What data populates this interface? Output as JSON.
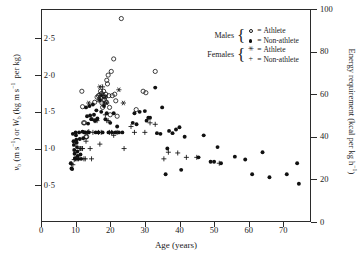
{
  "chart_data": {
    "type": "scatter",
    "title": "",
    "xlabel": "Age (years)",
    "ylabel": "v_b (m s^-1) or W_b (kg m s^-1 per kg)",
    "y2label": "Energy requirement (kcal per kg h^-1)",
    "xlim": [
      0,
      78
    ],
    "ylim": [
      0,
      2.9
    ],
    "y2lim": [
      0,
      100
    ],
    "grid": false,
    "legend_position": "top-right",
    "xticks": [
      0,
      10,
      20,
      30,
      40,
      50,
      60,
      70
    ],
    "xticklabels": [
      "0",
      "10",
      "20",
      "30",
      "40",
      "50",
      "60",
      "70"
    ],
    "yticks": [
      0.5,
      1.0,
      1.5,
      2.0,
      2.5
    ],
    "yticklabels": [
      "0·5",
      "1·0",
      "1·5",
      "2·0",
      "2·5"
    ],
    "y2ticks": [
      0,
      20,
      40,
      60,
      80,
      100
    ],
    "y2ticklabels": [
      "0",
      "20",
      "40",
      "60",
      "80",
      "100"
    ],
    "series": [
      {
        "name": "Males — Athlete",
        "marker": "open-circle",
        "points": [
          [
            11.8,
            1.78
          ],
          [
            12.0,
            1.57
          ],
          [
            12.3,
            1.35
          ],
          [
            12.6,
            1.35
          ],
          [
            13.0,
            1.16
          ],
          [
            13.2,
            1.16
          ],
          [
            15.5,
            1.63
          ],
          [
            16.2,
            1.7
          ],
          [
            16.6,
            1.72
          ],
          [
            16.8,
            1.66
          ],
          [
            17.0,
            1.73
          ],
          [
            17.2,
            1.78
          ],
          [
            17.3,
            1.7
          ],
          [
            17.5,
            1.75
          ],
          [
            17.6,
            1.62
          ],
          [
            17.8,
            1.56
          ],
          [
            18.0,
            1.72
          ],
          [
            18.1,
            1.78
          ],
          [
            18.3,
            1.66
          ],
          [
            18.5,
            1.7
          ],
          [
            18.7,
            1.74
          ],
          [
            18.9,
            1.63
          ],
          [
            19.0,
            1.93
          ],
          [
            19.2,
            1.88
          ],
          [
            19.4,
            2.0
          ],
          [
            19.6,
            1.72
          ],
          [
            19.8,
            1.56
          ],
          [
            20.0,
            1.46
          ],
          [
            20.3,
            2.05
          ],
          [
            20.6,
            1.72
          ],
          [
            21.0,
            2.22
          ],
          [
            21.3,
            1.74
          ],
          [
            21.6,
            1.65
          ],
          [
            22.0,
            1.44
          ],
          [
            23.2,
            2.77
          ],
          [
            27.5,
            1.53
          ],
          [
            29.5,
            1.78
          ],
          [
            30.3,
            1.76
          ],
          [
            33.0,
            2.05
          ]
        ]
      },
      {
        "name": "Males — Non-athlete",
        "marker": "filled-circle",
        "points": [
          [
            8.6,
            0.8
          ],
          [
            8.8,
            0.73
          ],
          [
            9.0,
            0.72
          ],
          [
            9.2,
            1.2
          ],
          [
            9.4,
            1.1
          ],
          [
            9.5,
            1.05
          ],
          [
            9.6,
            0.98
          ],
          [
            9.7,
            0.93
          ],
          [
            9.8,
            0.87
          ],
          [
            9.9,
            0.86
          ],
          [
            10.0,
            1.22
          ],
          [
            10.1,
            1.18
          ],
          [
            10.2,
            1.12
          ],
          [
            10.3,
            1.08
          ],
          [
            10.4,
            1.02
          ],
          [
            10.5,
            0.96
          ],
          [
            10.6,
            0.9
          ],
          [
            10.8,
            0.86
          ],
          [
            11.0,
            1.22
          ],
          [
            11.2,
            1.13
          ],
          [
            11.4,
            0.92
          ],
          [
            11.6,
            0.86
          ],
          [
            12.0,
            1.23
          ],
          [
            12.2,
            1.14
          ],
          [
            12.5,
            1.22
          ],
          [
            12.8,
            1.22
          ],
          [
            13.0,
            1.56
          ],
          [
            13.3,
            1.44
          ],
          [
            13.6,
            1.34
          ],
          [
            13.8,
            1.22
          ],
          [
            14.0,
            1.58
          ],
          [
            14.2,
            1.45
          ],
          [
            14.5,
            1.4
          ],
          [
            14.7,
            1.4
          ],
          [
            15.0,
            1.6
          ],
          [
            15.3,
            1.46
          ],
          [
            15.6,
            1.38
          ],
          [
            15.8,
            1.22
          ],
          [
            16.0,
            1.52
          ],
          [
            16.3,
            1.41
          ],
          [
            16.6,
            1.22
          ],
          [
            17.0,
            1.66
          ],
          [
            17.4,
            1.5
          ],
          [
            17.8,
            1.22
          ],
          [
            18.2,
            1.58
          ],
          [
            18.6,
            1.4
          ],
          [
            19.0,
            1.48
          ],
          [
            19.5,
            1.22
          ],
          [
            20.0,
            1.35
          ],
          [
            20.5,
            1.22
          ],
          [
            21.0,
            1.48
          ],
          [
            21.5,
            1.22
          ],
          [
            22.0,
            1.3
          ],
          [
            22.5,
            1.22
          ],
          [
            23.5,
            1.22
          ],
          [
            26.5,
            1.35
          ],
          [
            27.0,
            1.48
          ],
          [
            27.6,
            1.33
          ],
          [
            28.5,
            1.5
          ],
          [
            30.0,
            1.51
          ],
          [
            30.5,
            1.38
          ],
          [
            31.0,
            1.42
          ],
          [
            31.5,
            1.42
          ],
          [
            33.0,
            1.83
          ],
          [
            33.5,
            1.21
          ],
          [
            34.5,
            1.2
          ],
          [
            35.0,
            1.56
          ],
          [
            36.0,
            0.65
          ],
          [
            36.5,
            1.0
          ],
          [
            37.0,
            1.24
          ],
          [
            38.0,
            1.21
          ],
          [
            39.0,
            1.26
          ],
          [
            40.0,
            1.29
          ],
          [
            40.5,
            0.71
          ],
          [
            41.5,
            1.16
          ],
          [
            45.5,
            0.88
          ],
          [
            47.0,
            1.18
          ],
          [
            51.0,
            1.02
          ],
          [
            49.0,
            0.82
          ],
          [
            50.0,
            0.82
          ],
          [
            52.0,
            0.8
          ],
          [
            56.0,
            0.89
          ],
          [
            59.0,
            0.85
          ],
          [
            61.0,
            0.65
          ],
          [
            64.0,
            0.95
          ],
          [
            66.0,
            0.61
          ],
          [
            71.0,
            0.65
          ],
          [
            74.0,
            0.8
          ],
          [
            74.5,
            0.52
          ]
        ]
      },
      {
        "name": "Females — Athlete",
        "marker": "star",
        "points": [
          [
            13.8,
            1.62
          ],
          [
            17.0,
            1.84
          ],
          [
            17.5,
            1.72
          ],
          [
            18.6,
            1.7
          ],
          [
            19.0,
            1.62
          ],
          [
            22.5,
            1.8
          ],
          [
            23.8,
            1.62
          ]
        ]
      },
      {
        "name": "Females — Non-athlete",
        "marker": "plus",
        "points": [
          [
            8.8,
            0.79
          ],
          [
            9.2,
            0.78
          ],
          [
            9.6,
            0.85
          ],
          [
            10.0,
            0.86
          ],
          [
            10.4,
            0.86
          ],
          [
            10.8,
            0.86
          ],
          [
            11.2,
            1.0
          ],
          [
            11.4,
            1.0
          ],
          [
            11.8,
            1.0
          ],
          [
            12.0,
            1.0
          ],
          [
            12.4,
            0.86
          ],
          [
            12.8,
            0.86
          ],
          [
            13.0,
            1.1
          ],
          [
            13.4,
            1.22
          ],
          [
            13.8,
            1.23
          ],
          [
            14.2,
            1.0
          ],
          [
            14.6,
            0.86
          ],
          [
            15.0,
            1.22
          ],
          [
            15.4,
            1.38
          ],
          [
            15.8,
            1.38
          ],
          [
            16.2,
            1.38
          ],
          [
            16.6,
            1.22
          ],
          [
            17.0,
            1.06
          ],
          [
            17.4,
            1.22
          ],
          [
            17.8,
            1.84
          ],
          [
            18.2,
            1.62
          ],
          [
            18.6,
            1.46
          ],
          [
            19.0,
            1.38
          ],
          [
            19.4,
            1.38
          ],
          [
            19.8,
            1.22
          ],
          [
            20.4,
            1.22
          ],
          [
            21.0,
            1.18
          ],
          [
            22.0,
            1.22
          ],
          [
            24.0,
            1.0
          ],
          [
            26.0,
            1.3
          ],
          [
            27.0,
            1.22
          ],
          [
            30.0,
            1.22
          ],
          [
            31.5,
            1.35
          ],
          [
            33.0,
            1.33
          ],
          [
            35.5,
            0.86
          ],
          [
            36.8,
            0.95
          ],
          [
            39.5,
            0.94
          ],
          [
            42.0,
            0.88
          ],
          [
            45.0,
            0.88
          ],
          [
            51.5,
            0.8
          ]
        ]
      }
    ]
  },
  "legend": {
    "groups": [
      {
        "category": "Males",
        "rows": [
          {
            "marker": "open-circle",
            "equals": "=",
            "label": "Athlete"
          },
          {
            "marker": "filled-circle",
            "equals": "=",
            "label": "Non-athlete"
          }
        ]
      },
      {
        "category": "Females",
        "rows": [
          {
            "marker": "star",
            "equals": "=",
            "label": "Athlete"
          },
          {
            "marker": "plus",
            "equals": "=",
            "label": "Non-athlete"
          }
        ]
      }
    ]
  },
  "colors": {
    "axis": "#2b2b2b",
    "marker": "#111111",
    "background": "#ffffff"
  }
}
